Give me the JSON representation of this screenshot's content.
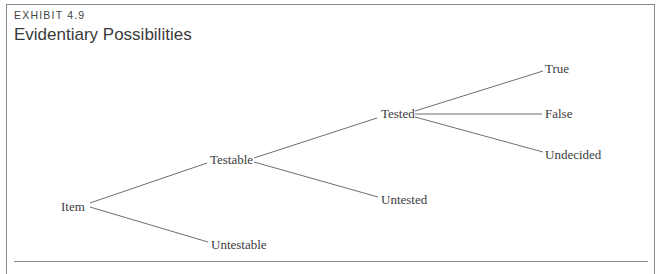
{
  "exhibit_label": "EXHIBIT 4.9",
  "title": "Evidentiary Possibilities",
  "tree": {
    "root": "Item",
    "nodes": {
      "item": "Item",
      "testable": "Testable",
      "untestable": "Untestable",
      "tested": "Tested",
      "untested": "Untested",
      "true": "True",
      "false": "False",
      "undecided": "Undecided"
    },
    "edges": [
      [
        "Item",
        "Testable"
      ],
      [
        "Item",
        "Untestable"
      ],
      [
        "Testable",
        "Tested"
      ],
      [
        "Testable",
        "Untested"
      ],
      [
        "Tested",
        "True"
      ],
      [
        "Tested",
        "False"
      ],
      [
        "Tested",
        "Undecided"
      ]
    ]
  },
  "colors": {
    "line": "#6e6e6e",
    "text": "#3c3c3c",
    "border": "#8a8a8a"
  }
}
